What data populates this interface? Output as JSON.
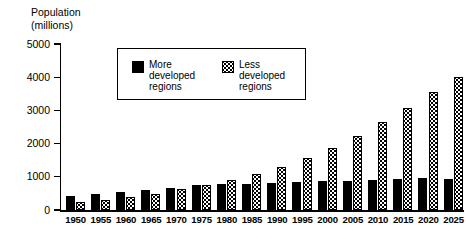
{
  "chart_data": {
    "type": "bar",
    "title": "Population (millions)",
    "title_line1": "Population",
    "title_line2": "(millions)",
    "xlabel": "",
    "ylabel": "Population (millions)",
    "ylim": [
      0,
      5000
    ],
    "yticks": [
      0,
      1000,
      2000,
      3000,
      4000,
      5000
    ],
    "ytick_labels": [
      "0",
      "1000",
      "2000",
      "3000",
      "4000",
      "5000"
    ],
    "grid": false,
    "legend_position": "upper-center",
    "categories": [
      "1950",
      "1955",
      "1960",
      "1965",
      "1970",
      "1975",
      "1980",
      "1985",
      "1990",
      "1995",
      "2000",
      "2005",
      "2010",
      "2015",
      "2020",
      "2025"
    ],
    "series": [
      {
        "name": "More developed regions",
        "legend_label_line1": "More",
        "legend_label_line2": "developed",
        "legend_label_line3": "regions",
        "fill": "solid-black",
        "color": "#000000",
        "values": [
          420,
          490,
          530,
          590,
          670,
          740,
          780,
          790,
          820,
          850,
          880,
          880,
          910,
          920,
          950,
          940
        ]
      },
      {
        "name": "Less developed regions",
        "legend_label_line1": "Less",
        "legend_label_line2": "developed",
        "legend_label_line3": "regions",
        "fill": "dotted-speckle",
        "color": "#000000",
        "values": [
          230,
          290,
          400,
          490,
          630,
          760,
          900,
          1080,
          1300,
          1580,
          1880,
          2220,
          2650,
          3070,
          3540,
          4010
        ]
      }
    ]
  }
}
